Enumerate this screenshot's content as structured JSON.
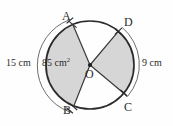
{
  "figure": {
    "type": "circle-sector-diagram",
    "background_color": "#fefefe",
    "stroke_color": "#2b2b2b",
    "shade_color": "#d6d6d6",
    "circle": {
      "center_label": "O",
      "center_x": 90,
      "center_y": 65,
      "radius": 44
    },
    "points": [
      {
        "name": "A",
        "label": "A",
        "angle_deg": 113,
        "label_x": 62,
        "label_y": 10,
        "tick": true
      },
      {
        "name": "D",
        "label": "D",
        "angle_deg": 50,
        "label_x": 124,
        "label_y": 16,
        "tick": true
      },
      {
        "name": "C",
        "label": "C",
        "angle_deg": -40,
        "label_x": 124,
        "label_y": 101,
        "tick": true
      },
      {
        "name": "B",
        "label": "B",
        "angle_deg": -112,
        "label_x": 63,
        "label_y": 104,
        "tick": true
      }
    ],
    "sectors": [
      {
        "name": "sector-AOB",
        "from": "A",
        "to": "B",
        "shaded": true,
        "area_label": "85 cm",
        "area_unit_exponent": "2"
      },
      {
        "name": "sector-DOC",
        "from": "D",
        "to": "C",
        "shaded": true
      }
    ],
    "measurements": [
      {
        "name": "arc-AB-length",
        "value": "15 cm",
        "side": "left",
        "label_x": 6,
        "label_y": 58
      },
      {
        "name": "arc-DC-length",
        "value": "9 cm",
        "side": "right",
        "label_x": 142,
        "label_y": 58
      }
    ],
    "area_label": {
      "name": "sector-area-label",
      "text": "85 cm",
      "exponent": "2",
      "label_x": 42,
      "label_y": 58
    }
  }
}
